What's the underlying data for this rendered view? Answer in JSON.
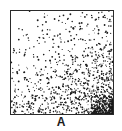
{
  "figure": {
    "label": "A",
    "panel": {
      "description": "stippled square with dot density increasing toward bottom-right corner",
      "dot_color": "#1a1a1a",
      "border_color": "#2a2a2a",
      "background_color": "#ffffff"
    }
  }
}
